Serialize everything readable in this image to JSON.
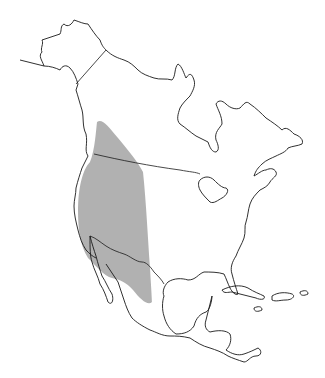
{
  "map": {
    "title": "Species range map — North America",
    "region": "North America",
    "range_label": "Range",
    "range_color": "#a9a9a9",
    "outline_color": "#1a1a1a",
    "background_color": "#ffffff",
    "features": [
      "Alaska",
      "Canada",
      "United States",
      "Mexico",
      "Central America",
      "Caribbean islands",
      "Great Lakes",
      "Hudson Bay"
    ],
    "range_description": "Western North America: from interior British Columbia south through the western United States to northern Mexico"
  }
}
